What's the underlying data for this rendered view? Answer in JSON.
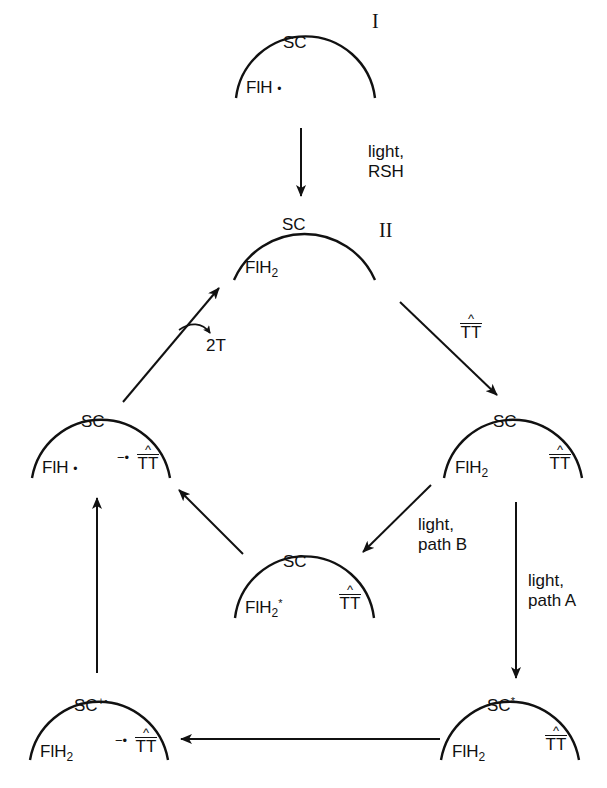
{
  "diagram": {
    "colors": {
      "ink": "#111111",
      "background": "#ffffff"
    },
    "states": [
      {
        "id": "I",
        "roman": "I",
        "protein": "SC",
        "cofactor": "FlH",
        "cofactor_mark": "•",
        "substrate": ""
      },
      {
        "id": "II",
        "roman": "II",
        "protein": "SC",
        "cofactor": "FlH",
        "cofactor_sub": "2",
        "substrate": ""
      },
      {
        "id": "bound",
        "protein": "SC",
        "cofactor": "FlH",
        "cofactor_sub": "2",
        "substrate": "TT",
        "substrate_mark": "^"
      },
      {
        "id": "excited-B",
        "protein": "SC",
        "cofactor": "FlH",
        "cofactor_sub": "2",
        "cofactor_sup": "*",
        "substrate": "TT",
        "substrate_mark": "^"
      },
      {
        "id": "excited-A",
        "protein": "SC",
        "protein_sup": "*",
        "cofactor": "FlH",
        "cofactor_sub": "2",
        "substrate": "TT",
        "substrate_mark": "^"
      },
      {
        "id": "charge-sep",
        "protein": "SC",
        "protein_sup": "+•",
        "cofactor": "FlH",
        "cofactor_sub": "2",
        "substrate": "TT",
        "substrate_prefix": "−•",
        "substrate_mark": "^"
      },
      {
        "id": "radical",
        "protein": "SC",
        "cofactor": "FlH",
        "cofactor_mark": "•",
        "substrate": "TT",
        "substrate_prefix": "−•",
        "substrate_mark": "^"
      }
    ],
    "arrows": [
      {
        "from": "I",
        "to": "II",
        "label_line1": "light,",
        "label_line2": "RSH"
      },
      {
        "from": "II",
        "to": "bound",
        "label": "TT",
        "label_mark": "^"
      },
      {
        "from": "bound",
        "to": "excited-B",
        "label_line1": "light,",
        "label_line2": "path B"
      },
      {
        "from": "bound",
        "to": "excited-A",
        "label_line1": "light,",
        "label_line2": "path A"
      },
      {
        "from": "excited-A",
        "to": "charge-sep",
        "label": ""
      },
      {
        "from": "charge-sep",
        "to": "radical",
        "label": ""
      },
      {
        "from": "excited-B",
        "to": "radical",
        "label": ""
      },
      {
        "from": "radical",
        "to": "II",
        "label": "2T",
        "release": true
      }
    ]
  }
}
